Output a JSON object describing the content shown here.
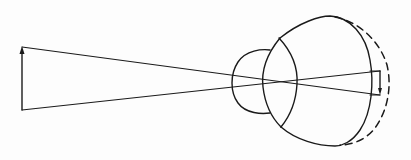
{
  "diagram": {
    "title": "Eye optics: image formation with elongated eyeball",
    "colors": {
      "stroke": "#1a1a1a",
      "background": "#fdfdfd"
    },
    "elements": {
      "object_arrow": {
        "label": "object (upright arrow)",
        "x": 22,
        "y_top": 47,
        "y_bottom": 110
      },
      "rays": [
        {
          "name": "upper-ray",
          "from": [
            22,
            47
          ],
          "to": [
            380,
            95
          ]
        },
        {
          "name": "lower-ray",
          "from": [
            22,
            110
          ],
          "to": [
            380,
            71
          ]
        }
      ],
      "cornea": {
        "label": "cornea"
      },
      "lens": {
        "label": "lens"
      },
      "eyeball": {
        "label": "eyeball (normal outline)"
      },
      "elongated_outline": {
        "label": "elongated eyeball (dashed outline)"
      },
      "image_arrow": {
        "label": "image (inverted arrow)",
        "x": 380,
        "y_top": 71,
        "y_bottom": 95
      }
    }
  }
}
